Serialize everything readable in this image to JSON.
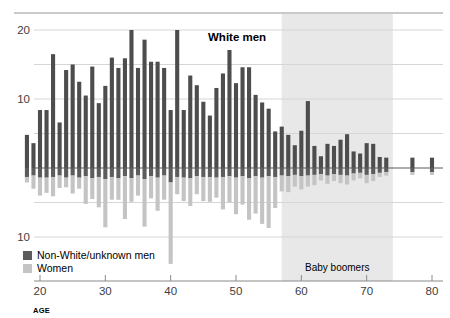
{
  "chart_data": {
    "type": "bar",
    "title": "White men",
    "xlabel": "AGE",
    "ylabel": "",
    "orientation": "diverging-vertical",
    "grid": true,
    "legend_position": "bottom-left",
    "xlim": [
      18,
      81
    ],
    "x_ticks": [
      20,
      30,
      40,
      50,
      60,
      70,
      80
    ],
    "y_ticks_up": [
      10,
      20
    ],
    "y_ticks_down": [
      10
    ],
    "y_gridlines_up": [
      5,
      10,
      15,
      20
    ],
    "y_gridlines_down": [
      5,
      10
    ],
    "ylim_up": [
      0,
      21
    ],
    "ylim_down": [
      0,
      14
    ],
    "annotations": [
      {
        "text": "Baby boomers",
        "x_start": 57,
        "x_end": 74,
        "shaded": true
      }
    ],
    "legend": [
      {
        "label": "Non-White/unknown men",
        "color": "#5c5c5c"
      },
      {
        "label": "Women",
        "color": "#c4c4c4"
      }
    ],
    "series": [
      {
        "name": "White men",
        "direction": "up",
        "color": "#4d4d4d",
        "x": [
          18,
          19,
          20,
          21,
          22,
          23,
          24,
          25,
          26,
          27,
          28,
          29,
          30,
          31,
          32,
          33,
          34,
          35,
          36,
          37,
          38,
          39,
          40,
          41,
          42,
          43,
          44,
          45,
          46,
          47,
          48,
          49,
          50,
          51,
          52,
          53,
          54,
          55,
          56,
          57,
          58,
          59,
          60,
          61,
          62,
          63,
          64,
          65,
          66,
          67,
          68,
          69,
          70,
          71,
          72,
          73,
          74,
          75,
          76,
          77,
          78,
          79,
          80
        ],
        "values": [
          4.8,
          3.6,
          8.4,
          8.4,
          16.5,
          6.6,
          14.2,
          15.0,
          12.5,
          10.5,
          14.7,
          9.4,
          11.9,
          16.0,
          14.5,
          15.9,
          20.0,
          14.5,
          18.6,
          15.4,
          15.4,
          14.5,
          8.4,
          20.0,
          8.4,
          13.4,
          12.0,
          9.6,
          7.6,
          11.6,
          13.7,
          17.1,
          12.3,
          14.6,
          14.6,
          10.6,
          9.5,
          8.6,
          5.3,
          6.0,
          4.8,
          3.3,
          5.4,
          9.7,
          3.2,
          1.7,
          3.5,
          3.2,
          4.1,
          4.9,
          2.4,
          2.1,
          3.6,
          3.5,
          1.6,
          1.5,
          0,
          0,
          0,
          1.5,
          0,
          0,
          1.5
        ]
      },
      {
        "name": "Non-White/unknown men",
        "direction": "down",
        "color": "#5c5c5c",
        "x": [
          18,
          19,
          20,
          21,
          22,
          23,
          24,
          25,
          26,
          27,
          28,
          29,
          30,
          31,
          32,
          33,
          34,
          35,
          36,
          37,
          38,
          39,
          40,
          41,
          42,
          43,
          44,
          45,
          46,
          47,
          48,
          49,
          50,
          51,
          52,
          53,
          54,
          55,
          56,
          57,
          58,
          59,
          60,
          61,
          62,
          63,
          64,
          65,
          66,
          67,
          68,
          69,
          70,
          71,
          72,
          73,
          74,
          75,
          76,
          77,
          78,
          79,
          80
        ],
        "values": [
          1.3,
          1.1,
          1.4,
          1.4,
          1.3,
          1.1,
          1.4,
          1.1,
          1.4,
          1.2,
          1.5,
          1.3,
          1.6,
          1.3,
          1.5,
          1.2,
          1.5,
          1.1,
          1.6,
          1.2,
          1.4,
          1.1,
          2.1,
          1.3,
          1.4,
          1.5,
          1.2,
          1.3,
          1.3,
          1.4,
          1.3,
          1.2,
          1.4,
          1.2,
          1.5,
          1.2,
          1.4,
          1.2,
          1.3,
          1.1,
          1.2,
          1.0,
          1.2,
          1.1,
          1.0,
          0.9,
          1.1,
          0.9,
          1.0,
          1.1,
          0.8,
          0.7,
          1.0,
          0.9,
          0.7,
          0.6,
          0,
          0,
          0,
          0.6,
          0,
          0,
          0.6
        ]
      },
      {
        "name": "Women",
        "direction": "down",
        "color": "#c4c4c4",
        "x": [
          18,
          19,
          20,
          21,
          22,
          23,
          24,
          25,
          26,
          27,
          28,
          29,
          30,
          31,
          32,
          33,
          34,
          35,
          36,
          37,
          38,
          39,
          40,
          41,
          42,
          43,
          44,
          45,
          46,
          47,
          48,
          49,
          50,
          51,
          52,
          53,
          54,
          55,
          56,
          57,
          58,
          59,
          60,
          61,
          62,
          63,
          64,
          65,
          66,
          67,
          68,
          69,
          70,
          71,
          72,
          73,
          74,
          75,
          76,
          77,
          78,
          79,
          80
        ],
        "values": [
          0.8,
          1.9,
          2.6,
          2.2,
          2.8,
          1.8,
          1.4,
          2.6,
          1.6,
          4.0,
          3.0,
          4.4,
          7.0,
          3.3,
          3.1,
          6.2,
          3.4,
          2.9,
          6.9,
          3.2,
          4.8,
          3.5,
          11.8,
          2.5,
          3.4,
          4.0,
          2.6,
          3.5,
          3.6,
          2.9,
          4.7,
          3.8,
          5.3,
          4.1,
          6.0,
          5.4,
          6.7,
          7.5,
          4.5,
          2.3,
          2.3,
          1.7,
          1.9,
          1.6,
          1.5,
          0.9,
          1.2,
          1.0,
          1.2,
          1.3,
          1.0,
          0.8,
          1.2,
          1.0,
          0.6,
          0.5,
          0,
          0,
          0,
          0.4,
          0,
          0,
          0.4
        ]
      }
    ]
  },
  "colors": {
    "white_men": "#4d4d4d",
    "nonwhite_men": "#5c5c5c",
    "women": "#c4c4c4",
    "band": "#e8e8e8",
    "grid": "#d6d6d6",
    "axis": "#8a8a8a"
  }
}
